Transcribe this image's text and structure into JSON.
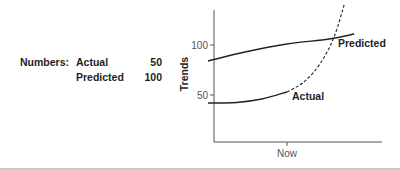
{
  "numbers": {
    "label": "Numbers:",
    "rows": [
      {
        "name": "Actual",
        "value": "50"
      },
      {
        "name": "Predicted",
        "value": "100"
      }
    ]
  },
  "chart_data": {
    "type": "line",
    "title": "",
    "xlabel": "",
    "ylabel": "Trends",
    "x_ticks": [
      {
        "label": "Now",
        "x": 0.5
      }
    ],
    "y_ticks": [
      {
        "label": "100",
        "value": 100
      },
      {
        "label": "50",
        "value": 50
      }
    ],
    "ylim": [
      3,
      143
    ],
    "xlim": [
      0,
      1
    ],
    "grid": false,
    "series": [
      {
        "name": "Predicted",
        "style": "solid",
        "points": [
          [
            0.03,
            84
          ],
          [
            0.25,
            93
          ],
          [
            0.5,
            101
          ],
          [
            0.75,
            106
          ],
          [
            0.9,
            111
          ]
        ]
      },
      {
        "name": "Actual",
        "style": "solid",
        "points": [
          [
            0.03,
            42
          ],
          [
            0.2,
            42.5
          ],
          [
            0.35,
            46
          ],
          [
            0.5,
            53
          ]
        ]
      },
      {
        "name": "Actual (projected)",
        "style": "dashed",
        "points": [
          [
            0.5,
            53
          ],
          [
            0.6,
            63
          ],
          [
            0.7,
            82
          ],
          [
            0.78,
            108
          ],
          [
            0.84,
            140
          ]
        ]
      }
    ],
    "annotations": [
      {
        "text": "Predicted",
        "near_series": "Predicted"
      },
      {
        "text": "Actual",
        "near_series": "Actual"
      }
    ]
  }
}
